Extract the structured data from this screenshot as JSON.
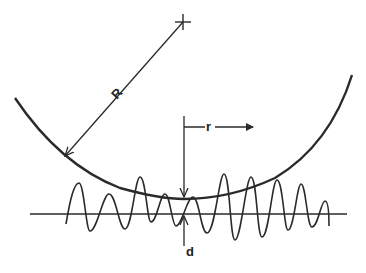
{
  "diagram": {
    "type": "contact-geometry",
    "labels": {
      "radius_large": "R",
      "radius_small": "r",
      "separation": "d"
    },
    "colors": {
      "stroke": "#2a2a2a",
      "background": "#ffffff"
    },
    "center_marker": {
      "x": 183,
      "y": 22
    },
    "arc": {
      "start": [
        15,
        98
      ],
      "through": [
        64,
        157
      ],
      "bottom": [
        184,
        199
      ],
      "end": [
        352,
        75
      ]
    },
    "radius_line": {
      "from": [
        183,
        22
      ],
      "to": [
        64,
        157
      ]
    },
    "r_arrow": {
      "vertical_x": 184,
      "top_y": 116,
      "y": 127,
      "x_end": 253
    },
    "baseline": {
      "y": 214,
      "x_start": 30,
      "x_end": 347
    },
    "profile_points": [
      [
        66,
        224
      ],
      [
        79,
        183
      ],
      [
        90,
        231
      ],
      [
        109,
        194
      ],
      [
        125,
        229
      ],
      [
        140,
        177
      ],
      [
        151,
        222
      ],
      [
        165,
        194
      ],
      [
        176,
        226
      ],
      [
        193,
        197
      ],
      [
        207,
        233
      ],
      [
        224,
        174
      ],
      [
        235,
        240
      ],
      [
        251,
        177
      ],
      [
        262,
        237
      ],
      [
        277,
        180
      ],
      [
        288,
        230
      ],
      [
        301,
        184
      ],
      [
        312,
        227
      ],
      [
        325,
        201
      ],
      [
        329,
        226
      ]
    ]
  }
}
